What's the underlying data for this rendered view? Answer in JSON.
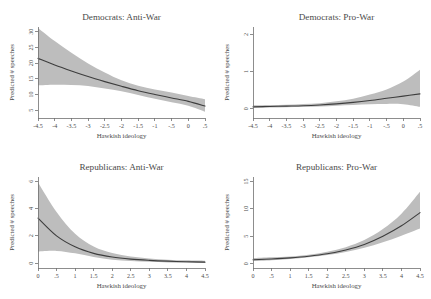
{
  "figure": {
    "background_color": "#ffffff",
    "band_color": "#bdbdbd",
    "line_color": "#3d3d3d",
    "axis_color": "#707070",
    "text_color": "#4a4a4a"
  },
  "chart_data": [
    {
      "type": "line",
      "title": "Democrats: Anti-War",
      "xlabel": "Hawkish ideology",
      "ylabel": "Predicted # speeches",
      "xlim": [
        -4.5,
        0.5
      ],
      "ylim": [
        2.5,
        31.5
      ],
      "xticks": [
        -4.5,
        -4,
        -3.5,
        -3,
        -2.5,
        -2,
        -1.5,
        -1,
        -0.5,
        0,
        0.5
      ],
      "xticklabels": [
        "-4.5",
        "-4",
        "-3.5",
        "-3",
        "-2.5",
        "-2",
        "-1.5",
        "-1",
        "-.5",
        "0",
        ".5"
      ],
      "yticks": [
        5,
        10,
        15,
        20,
        25,
        30
      ],
      "yticklabels": [
        "5",
        "10",
        "15",
        "20",
        "25",
        "30"
      ],
      "grid": false,
      "legend": "none",
      "x": [
        -4.5,
        -4.0,
        -3.5,
        -3.0,
        -2.5,
        -2.0,
        -1.5,
        -1.0,
        -0.5,
        0.0,
        0.5
      ],
      "series": [
        {
          "name": "Predicted # speeches",
          "values": [
            21.5,
            19.4,
            17.5,
            15.7,
            14.1,
            12.6,
            11.2,
            10.0,
            8.9,
            7.8,
            6.3
          ]
        },
        {
          "name": "95% CI lower",
          "values": [
            12.9,
            13.1,
            13.0,
            12.7,
            11.9,
            11.0,
            9.8,
            8.6,
            7.5,
            6.4,
            4.5
          ]
        },
        {
          "name": "95% CI upper",
          "values": [
            31.2,
            27.0,
            23.3,
            19.9,
            17.0,
            14.5,
            12.8,
            11.6,
            10.6,
            9.5,
            8.5
          ]
        }
      ]
    },
    {
      "type": "line",
      "title": "Democrats: Pro-War",
      "xlabel": "Hawkish ideology",
      "ylabel": "Predicted # speeches",
      "xlim": [
        -4.5,
        0.5
      ],
      "ylim": [
        -0.25,
        2.2
      ],
      "xticks": [
        -4.5,
        -4,
        -3.5,
        -3,
        -2.5,
        -2,
        -1.5,
        -1,
        -0.5,
        0,
        0.5
      ],
      "xticklabels": [
        "-4.5",
        "-4",
        "-3.5",
        "-3",
        "-2.5",
        "-2",
        "-1.5",
        "-1",
        "-.5",
        "0",
        ".5"
      ],
      "yticks": [
        0,
        1,
        2
      ],
      "yticklabels": [
        "0",
        "1",
        "2"
      ],
      "grid": false,
      "legend": "none",
      "x": [
        -4.5,
        -4.0,
        -3.5,
        -3.0,
        -2.5,
        -2.0,
        -1.5,
        -1.0,
        -0.5,
        0.0,
        0.5
      ],
      "series": [
        {
          "name": "Predicted # speeches",
          "values": [
            0.05,
            0.06,
            0.07,
            0.08,
            0.1,
            0.13,
            0.17,
            0.22,
            0.28,
            0.34,
            0.4
          ]
        },
        {
          "name": "95% CI lower",
          "values": [
            0.02,
            0.03,
            0.04,
            0.05,
            0.06,
            0.08,
            0.1,
            0.12,
            0.13,
            0.12,
            0.05
          ]
        },
        {
          "name": "95% CI upper",
          "values": [
            0.09,
            0.1,
            0.11,
            0.13,
            0.15,
            0.2,
            0.27,
            0.38,
            0.52,
            0.73,
            1.05
          ]
        }
      ]
    },
    {
      "type": "line",
      "title": "Republicans: Anti-War",
      "xlabel": "Hawkish ideology",
      "ylabel": "Predicted # speeches",
      "xlim": [
        0,
        4.5
      ],
      "ylim": [
        -0.35,
        6.3
      ],
      "xticks": [
        0,
        0.5,
        1,
        1.5,
        2,
        2.5,
        3,
        3.5,
        4,
        4.5
      ],
      "xticklabels": [
        "0",
        ".5",
        "1",
        "1.5",
        "2",
        "2.5",
        "3",
        "3.5",
        "4",
        "4.5"
      ],
      "yticks": [
        0,
        2,
        4,
        6
      ],
      "yticklabels": [
        "0",
        "2",
        "4",
        "6"
      ],
      "grid": false,
      "legend": "none",
      "x": [
        0,
        0.5,
        1.0,
        1.5,
        2.0,
        2.5,
        3.0,
        3.5,
        4.0,
        4.5
      ],
      "series": [
        {
          "name": "Predicted # speeches",
          "values": [
            3.3,
            2.0,
            1.2,
            0.72,
            0.45,
            0.3,
            0.21,
            0.15,
            0.11,
            0.08
          ]
        },
        {
          "name": "95% CI lower",
          "values": [
            0.85,
            0.9,
            0.72,
            0.45,
            0.26,
            0.16,
            0.1,
            0.06,
            0.04,
            0.02
          ]
        },
        {
          "name": "95% CI upper",
          "values": [
            5.9,
            3.75,
            2.15,
            1.22,
            0.74,
            0.49,
            0.35,
            0.26,
            0.21,
            0.18
          ]
        }
      ]
    },
    {
      "type": "line",
      "title": "Republicans: Pro-War",
      "xlabel": "Hawkish ideology",
      "ylabel": "Predicted # speeches",
      "xlim": [
        0,
        4.5
      ],
      "ylim": [
        -0.8,
        15.8
      ],
      "xticks": [
        0,
        0.5,
        1,
        1.5,
        2,
        2.5,
        3,
        3.5,
        4,
        4.5
      ],
      "xticklabels": [
        "0",
        ".5",
        "1",
        "1.5",
        "2",
        "2.5",
        "3",
        "3.5",
        "4",
        "4.5"
      ],
      "yticks": [
        0,
        5,
        10,
        15
      ],
      "yticklabels": [
        "0",
        "5",
        "10",
        "15"
      ],
      "grid": false,
      "legend": "none",
      "x": [
        0,
        0.5,
        1.0,
        1.5,
        2.0,
        2.5,
        3.0,
        3.5,
        4.0,
        4.5
      ],
      "series": [
        {
          "name": "Predicted # speeches",
          "values": [
            0.7,
            0.85,
            1.05,
            1.35,
            1.8,
            2.5,
            3.5,
            5.0,
            6.9,
            9.3
          ]
        },
        {
          "name": "95% CI lower",
          "values": [
            0.45,
            0.62,
            0.85,
            1.15,
            1.55,
            2.1,
            2.9,
            3.9,
            5.1,
            6.4
          ]
        },
        {
          "name": "95% CI upper",
          "values": [
            1.0,
            1.15,
            1.32,
            1.62,
            2.15,
            3.0,
            4.3,
            6.3,
            9.1,
            13.1
          ]
        }
      ]
    }
  ]
}
